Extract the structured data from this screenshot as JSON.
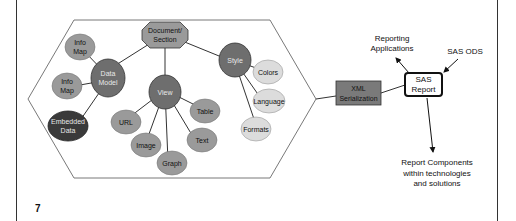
{
  "slide": {
    "page_number": "7"
  },
  "diagram": {
    "root": {
      "label_line1": "Document/",
      "label_line2": "Section"
    },
    "data_model": {
      "label_line1": "Data",
      "label_line2": "Model"
    },
    "info_map_1": {
      "label_line1": "Info",
      "label_line2": "Map"
    },
    "info_map_2": {
      "label_line1": "Info",
      "label_line2": "Map"
    },
    "embedded_data": {
      "label_line1": "Embedded",
      "label_line2": "Data"
    },
    "view": {
      "label": "View"
    },
    "url": {
      "label": "URL"
    },
    "image": {
      "label": "Image"
    },
    "graph": {
      "label": "Graph"
    },
    "text": {
      "label": "Text"
    },
    "table": {
      "label": "Table"
    },
    "style": {
      "label": "Style"
    },
    "colors": {
      "label": "Colors"
    },
    "language": {
      "label": "Language"
    },
    "formats": {
      "label": "Formats"
    },
    "xml": {
      "label_line1": "XML",
      "label_line2": "Serialization"
    },
    "sas_report": {
      "label_line1": "SAS",
      "label_line2": "Report"
    },
    "reporting_apps": {
      "label_line1": "Reporting",
      "label_line2": "Applications"
    },
    "sas_ods": {
      "label": "SAS ODS"
    },
    "report_components": {
      "label_line1": "Report Components",
      "label_line2": "within technologies",
      "label_line3": "and solutions"
    }
  },
  "colors": {
    "dark_node": "#6e6e6e",
    "medium_node": "#9a9a9a",
    "light_node": "#dcdcdc",
    "embedded_node": "#3a3a3a",
    "xml_box": "#7a7a7a"
  }
}
